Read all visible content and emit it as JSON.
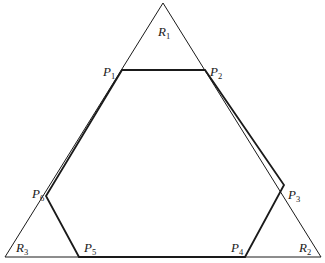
{
  "diagram": {
    "type": "triangle-with-inscribed-hexagon",
    "colors": {
      "background": "#ffffff",
      "line": "#1a1a1a"
    },
    "triangle": {
      "vertices": [
        {
          "id": "R1",
          "letter": "R",
          "sub": "1",
          "x": 163,
          "y": 3
        },
        {
          "id": "R2",
          "letter": "R",
          "sub": "2",
          "x": 321,
          "y": 257
        },
        {
          "id": "R3",
          "letter": "R",
          "sub": "3",
          "x": 5,
          "y": 257
        }
      ]
    },
    "hexagon": {
      "vertices": [
        {
          "id": "P1",
          "letter": "P",
          "sub": "1",
          "x": 122,
          "y": 70
        },
        {
          "id": "P2",
          "letter": "P",
          "sub": "2",
          "x": 205,
          "y": 70
        },
        {
          "id": "P3",
          "letter": "P",
          "sub": "3",
          "x": 284,
          "y": 185
        },
        {
          "id": "P4",
          "letter": "P",
          "sub": "4",
          "x": 245,
          "y": 257
        },
        {
          "id": "P5",
          "letter": "P",
          "sub": "5",
          "x": 79,
          "y": 257
        },
        {
          "id": "P6",
          "letter": "P",
          "sub": "6",
          "x": 46,
          "y": 196
        }
      ]
    },
    "labels": {
      "R1": {
        "letter": "R",
        "sub": "1"
      },
      "R2": {
        "letter": "R",
        "sub": "2"
      },
      "R3": {
        "letter": "R",
        "sub": "3"
      },
      "P1": {
        "letter": "P",
        "sub": "1"
      },
      "P2": {
        "letter": "P",
        "sub": "2"
      },
      "P3": {
        "letter": "P",
        "sub": "3"
      },
      "P4": {
        "letter": "P",
        "sub": "4"
      },
      "P5": {
        "letter": "P",
        "sub": "5"
      },
      "P6": {
        "letter": "P",
        "sub": "6"
      }
    }
  }
}
